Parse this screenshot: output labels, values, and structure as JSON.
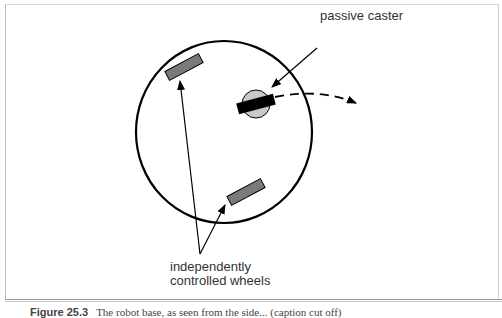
{
  "labels": {
    "caster": "passive caster",
    "wheels_line1": "independently",
    "wheels_line2": "controlled wheels"
  },
  "caption": {
    "figure_number": "Figure 25.3",
    "text": "The robot base, as seen from the side... (caption cut off)"
  },
  "colors": {
    "wheel_fill": "#7a7a7a",
    "caster_fill": "#c8c8c8",
    "stroke": "#000000"
  }
}
